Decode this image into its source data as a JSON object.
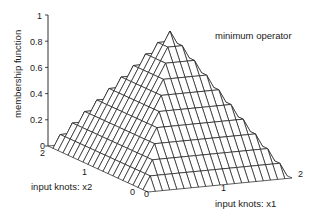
{
  "chart_data": {
    "type": "surface",
    "title": "",
    "annotation": "minimum operator",
    "xlabel": "input knots: x1",
    "ylabel": "input knots: x2",
    "zlabel": "membership function",
    "x_ticks": [
      "0",
      "1",
      "2"
    ],
    "y_ticks": [
      "0",
      "1",
      "2"
    ],
    "z_ticks": [
      "0",
      "0.2",
      "0.4",
      "0.6",
      "0.8",
      "1"
    ],
    "xlim": [
      0,
      2
    ],
    "ylim": [
      0,
      2
    ],
    "zlim": [
      0,
      1
    ],
    "grid_divisions": 20,
    "function": "z = min(mu(x1), mu(x2)), mu(t) = 1 - |t - 1| (triangular, peak 1 at t=1)",
    "peak": {
      "x1": 1,
      "x2": 1,
      "z": 1
    },
    "grid": false,
    "mesh_color": "#1a1a1a"
  },
  "labels": {
    "annotation": "minimum operator",
    "zlabel": "membership function",
    "xlabel": "input knots: x1",
    "ylabel": "input knots: x2"
  },
  "ticks": {
    "z": [
      "0",
      "0.2",
      "0.4",
      "0.6",
      "0.8",
      "1"
    ],
    "x1": [
      "0",
      "1",
      "2"
    ],
    "x2": [
      "0",
      "1",
      "2"
    ]
  }
}
